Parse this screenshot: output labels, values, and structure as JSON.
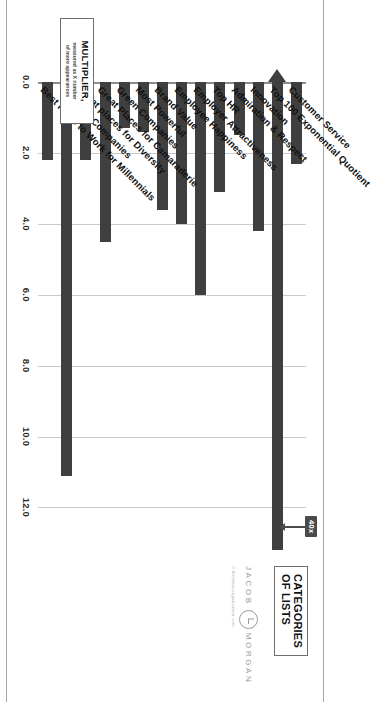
{
  "chart_data": {
    "type": "bar",
    "orientation": "horizontal",
    "title": "",
    "xlabel": "",
    "ylabel": "",
    "categories": [
      "Customer Service",
      "Top 100 Exponential Quotient",
      "Innovation",
      "Admiration & Respect",
      "Top HR",
      "Employer Attractiveness",
      "Employee Happiness",
      "Brand Value",
      "Most Powerful",
      "Green Companies",
      "Great Places for Camaraderie",
      "Great places for Diversity",
      "Smartest Companies",
      "Best Place to Work for Millennials"
    ],
    "values": [
      2.3,
      40.0,
      4.2,
      1.5,
      3.1,
      6.0,
      4.0,
      3.6,
      1.4,
      1.3,
      4.5,
      2.2,
      11.1,
      2.2
    ],
    "plotted_values": [
      2.3,
      13.2,
      4.2,
      1.5,
      3.1,
      6.0,
      4.0,
      3.6,
      1.4,
      1.3,
      4.5,
      2.2,
      11.1,
      2.2
    ],
    "tick_labels": [
      "0.0",
      "2.0",
      "4.0",
      "6.0",
      "8.0",
      "10.0",
      "12.0"
    ],
    "tick_values": [
      0.0,
      2.0,
      4.0,
      6.0,
      8.0,
      10.0,
      12.0
    ],
    "xlim": [
      0.0,
      13.2
    ],
    "grid": true,
    "legend_position": "none",
    "bar_color": "#3f3f3f",
    "grid_color": "#c9c9c9",
    "axis_color": "#8d8d8d",
    "annotations": [
      {
        "text": "40x",
        "target_category": "Top 100 Exponential Quotient",
        "note": "bar is broken / extends beyond axis"
      }
    ]
  },
  "multiplier_box": {
    "title": "MULTIPLIER,",
    "subtitle_line1": "measured as X number",
    "subtitle_line2": "of more appearances"
  },
  "categories_box": {
    "line1": "CATEGORIES",
    "line2": "OF LISTS"
  },
  "brand": {
    "word_left": "JACOB",
    "word_right": "MORGAN",
    "mark": "circled-j-monogram",
    "copyright": "© thefutureorganization.com"
  },
  "callout": {
    "label": "40x"
  },
  "colors": {
    "bar": "#3f3f3f",
    "grid": "#c9c9c9",
    "axis": "#8d8d8d",
    "text": "#111111",
    "brand": "#9a9a9a",
    "background": "#ffffff"
  }
}
